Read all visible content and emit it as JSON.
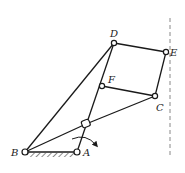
{
  "diagram": {
    "type": "linkage-mechanism",
    "points": {
      "B": {
        "label": "B",
        "x": 25,
        "y": 152
      },
      "A": {
        "label": "A",
        "x": 77,
        "y": 152
      },
      "S": {
        "label": "",
        "x": 86,
        "y": 124
      },
      "F": {
        "label": "F",
        "x": 102,
        "y": 86
      },
      "D": {
        "label": "D",
        "x": 114,
        "y": 43
      },
      "E": {
        "label": "E",
        "x": 166,
        "y": 52
      },
      "C": {
        "label": "C",
        "x": 155,
        "y": 96
      }
    },
    "links": [
      [
        "B",
        "A"
      ],
      [
        "B",
        "D"
      ],
      [
        "B",
        "S"
      ],
      [
        "S",
        "C"
      ],
      [
        "A",
        "D"
      ],
      [
        "D",
        "E"
      ],
      [
        "E",
        "C"
      ],
      [
        "F",
        "C"
      ]
    ],
    "ground": {
      "from": "B",
      "to": "A",
      "hatched": true
    },
    "guide_line": {
      "x": 170,
      "style": "dashed"
    },
    "rotation_arrow": {
      "at": "A",
      "direction": "clockwise"
    },
    "colors": {
      "line": "#1a1a1a",
      "background": "#ffffff",
      "guide": "#888888"
    }
  }
}
